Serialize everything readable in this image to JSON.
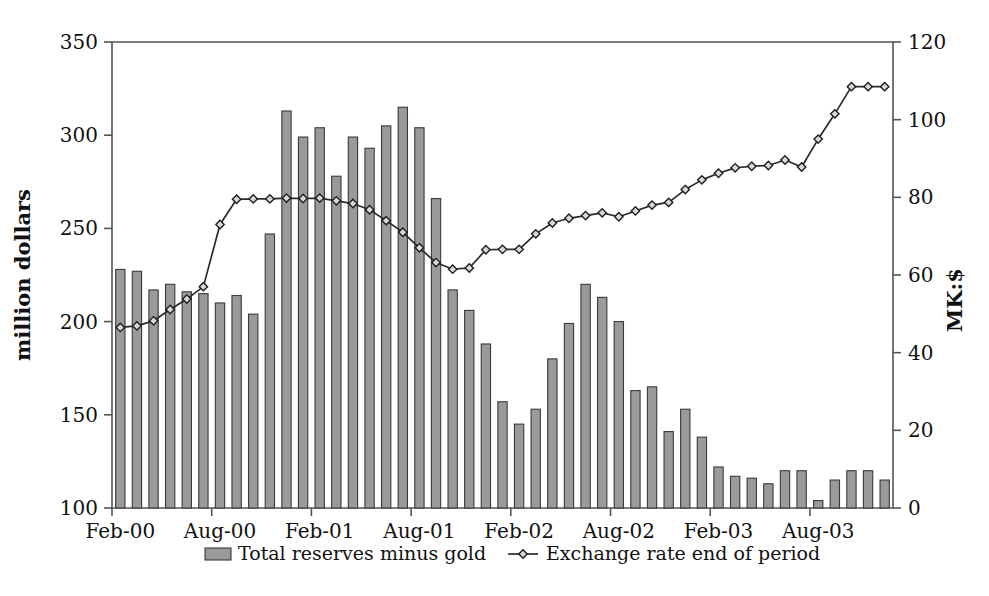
{
  "chart_data": {
    "type": "bar",
    "title": "",
    "subtitle": "",
    "xlabel": "",
    "ylabel": "million dollars",
    "y2label": "MK:$",
    "ylim": [
      100,
      350
    ],
    "yticks": [
      100,
      150,
      200,
      250,
      300,
      350
    ],
    "y2lim": [
      0,
      120
    ],
    "y2ticks": [
      0,
      20,
      40,
      60,
      80,
      100,
      120
    ],
    "grid": false,
    "legend_position": "bottom",
    "x_tick_labels": [
      "Feb-00",
      "Aug-00",
      "Feb-01",
      "Aug-01",
      "Feb-02",
      "Aug-02",
      "Feb-03",
      "Aug-03"
    ],
    "x_tick_indices": [
      0,
      6,
      12,
      18,
      24,
      30,
      36,
      42
    ],
    "categories": [
      "Feb-00",
      "Mar-00",
      "Apr-00",
      "May-00",
      "Jun-00",
      "Jul-00",
      "Aug-00",
      "Sep-00",
      "Oct-00",
      "Nov-00",
      "Dec-00",
      "Jan-01",
      "Feb-01",
      "Mar-01",
      "Apr-01",
      "May-01",
      "Jun-01",
      "Jul-01",
      "Aug-01",
      "Sep-01",
      "Oct-01",
      "Nov-01",
      "Dec-01",
      "Jan-02",
      "Feb-02",
      "Mar-02",
      "Apr-02",
      "May-02",
      "Jun-02",
      "Jul-02",
      "Aug-02",
      "Sep-02",
      "Oct-02",
      "Nov-02",
      "Dec-02",
      "Jan-03",
      "Feb-03",
      "Mar-03",
      "Apr-03",
      "May-03",
      "Jun-03",
      "Jul-03",
      "Aug-03",
      "Sep-03",
      "Oct-03",
      "Nov-03",
      "Dec-03"
    ],
    "series": [
      {
        "name": "Total reserves minus gold",
        "axis": "left",
        "render": "bar",
        "unit": "million dollars",
        "values": [
          228,
          227,
          217,
          220,
          216,
          215,
          210,
          214,
          204,
          247,
          313,
          299,
          304,
          278,
          299,
          293,
          305,
          315,
          304,
          266,
          217,
          206,
          188,
          157,
          145,
          153,
          180,
          199,
          220,
          213,
          200,
          163,
          165,
          141,
          153,
          138,
          122,
          117,
          116,
          113,
          120,
          120,
          104,
          115,
          120,
          120,
          115
        ]
      },
      {
        "name": "Exchange rate end of period",
        "axis": "right",
        "render": "line",
        "unit": "MK:$",
        "values": [
          46.5,
          46.9,
          48.2,
          51.1,
          53.8,
          57.0,
          73.0,
          79.5,
          79.6,
          79.6,
          79.8,
          79.7,
          79.8,
          79.1,
          78.4,
          76.8,
          74.0,
          71.0,
          67.0,
          63.2,
          61.5,
          61.8,
          66.5,
          66.6,
          66.6,
          70.6,
          73.4,
          74.6,
          75.3,
          76.0,
          75.0,
          76.5,
          78.0,
          78.7,
          82.0,
          84.5,
          86.2,
          87.6,
          88.0,
          88.2,
          89.6,
          87.8,
          95.0,
          101.5,
          108.5,
          108.5,
          108.5
        ]
      }
    ],
    "legend": [
      {
        "label": "Total reserves minus gold",
        "marker": "bar-swatch",
        "color": "#9a9a9a"
      },
      {
        "label": "Exchange rate end of period",
        "marker": "line-diamond",
        "color": "#2b2b2b"
      }
    ]
  }
}
